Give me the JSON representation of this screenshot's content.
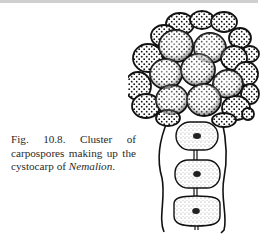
{
  "figure": {
    "label": "Fig. 10.8.",
    "caption_text": " Cluster of carpospores making up the cystocarp of ",
    "caption_italic": "Nemalion",
    "caption_end": ".",
    "illustration": {
      "subject": "cystocarp of Nemalion",
      "parts": [
        "carpospore-cluster",
        "gonimoblast-filament",
        "filament-cells"
      ],
      "cell_count": 3
    }
  },
  "colors": {
    "ink": "#111111",
    "caption_text": "#2a2a2a",
    "rule": "#cfcfcf",
    "background": "#ffffff"
  }
}
